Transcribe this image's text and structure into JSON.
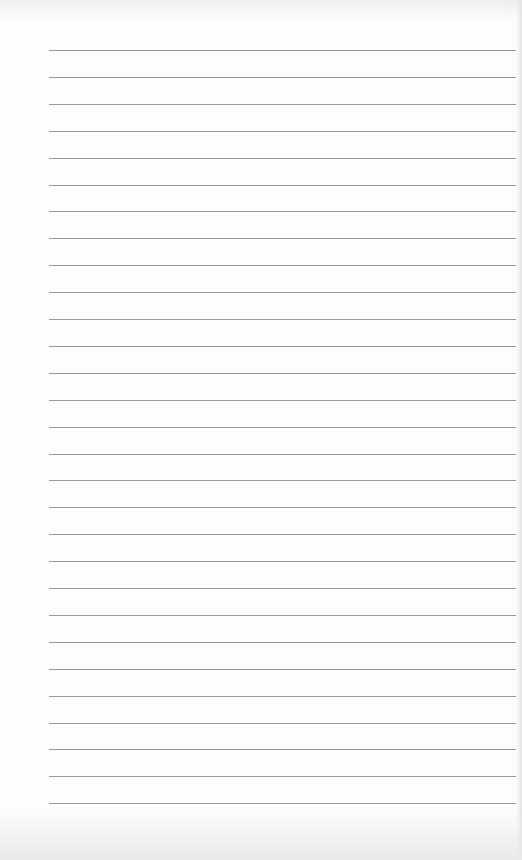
{
  "page": {
    "type": "lined-paper",
    "line_count": 29,
    "first_line_y": 50,
    "line_spacing": 26.9,
    "line_left": 49,
    "line_width": 467,
    "line_color": "#9a9a9a",
    "background_color": "#fdfdfd"
  }
}
